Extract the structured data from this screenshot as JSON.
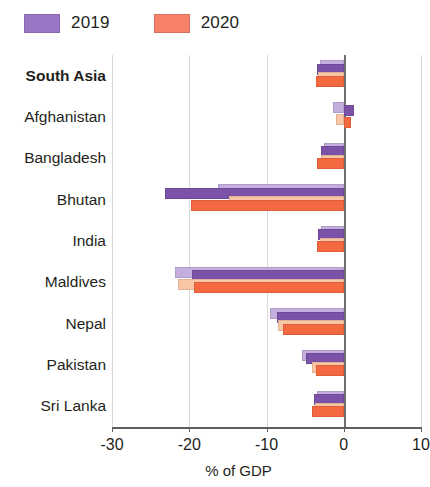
{
  "legend": {
    "items": [
      {
        "label": "2019",
        "color": "#7b52a8",
        "name": "legend-2019"
      },
      {
        "label": "2020",
        "color": "#f4693f",
        "name": "legend-2020"
      }
    ]
  },
  "axis": {
    "x_title": "% of GDP",
    "x_ticks": [
      "-30",
      "-20",
      "-10",
      "0",
      "10"
    ],
    "x_min": -30,
    "x_max": 10
  },
  "chart_data": {
    "type": "bar",
    "orientation": "horizontal",
    "title": "",
    "subtitle": "",
    "xlabel": "% of GDP",
    "ylabel": "",
    "xlim": [
      -30,
      10
    ],
    "xticks": [
      -30,
      -20,
      -10,
      0,
      10
    ],
    "grid": true,
    "legend_position": "top-left",
    "categories": [
      "South Asia",
      "Afghanistan",
      "Bangladesh",
      "Bhutan",
      "India",
      "Maldives",
      "Nepal",
      "Pakistan",
      "Sri Lanka"
    ],
    "bold_categories": [
      "South Asia"
    ],
    "series": [
      {
        "name": "2019",
        "color": "#7b52a8",
        "light_color": "#c3aede",
        "values": [
          -3.4,
          1.3,
          -3.0,
          -23.2,
          -3.3,
          -19.6,
          -8.7,
          -4.9,
          -3.8
        ],
        "light_values": [
          -3.1,
          -1.4,
          -2.5,
          -16.3,
          -2.9,
          -21.8,
          -9.6,
          -5.4,
          -3.4
        ]
      },
      {
        "name": "2020",
        "color": "#f4693f",
        "light_color": "#fac7a6",
        "values": [
          -3.6,
          1.0,
          -3.4,
          -19.8,
          -3.5,
          -19.4,
          -7.9,
          -3.6,
          -4.1
        ],
        "light_values": [
          -3.3,
          -1.0,
          -3.0,
          -14.9,
          -3.1,
          -21.5,
          -8.5,
          -4.1,
          -3.7
        ]
      }
    ]
  }
}
